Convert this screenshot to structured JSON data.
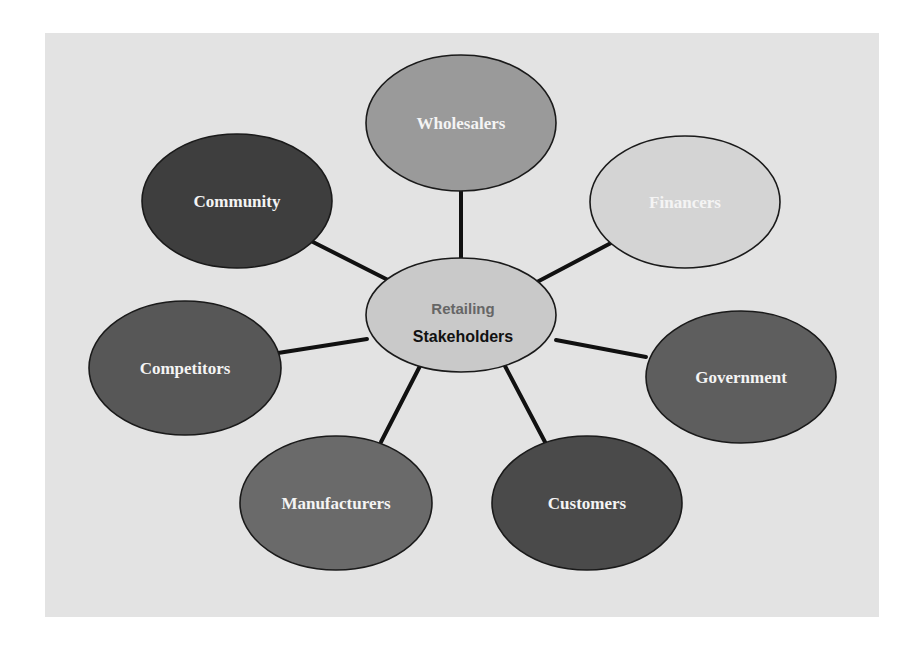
{
  "diagram": {
    "type": "hub-and-spoke",
    "center": {
      "line1": "Retailing",
      "line2": "Stakeholders",
      "fill": "#c9c9c9"
    },
    "nodes": [
      {
        "id": "wholesalers",
        "label": "Wholesalers",
        "fill": "#9a9a9a"
      },
      {
        "id": "financers",
        "label": "Financers",
        "fill": "#d4d4d4"
      },
      {
        "id": "government",
        "label": "Government",
        "fill": "#5e5e5e"
      },
      {
        "id": "customers",
        "label": "Customers",
        "fill": "#4a4a4a"
      },
      {
        "id": "manufacturers",
        "label": "Manufacturers",
        "fill": "#6a6a6a"
      },
      {
        "id": "competitors",
        "label": "Competitors",
        "fill": "#575757"
      },
      {
        "id": "community",
        "label": "Community",
        "fill": "#3e3e3e"
      }
    ],
    "background": "#e3e3e3"
  }
}
